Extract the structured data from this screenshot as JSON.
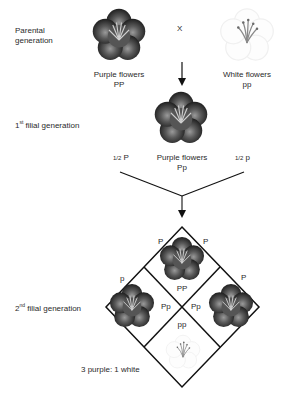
{
  "parental": {
    "label": "Parental generation",
    "label_line1": "Parental",
    "label_line2": "generation",
    "cross_symbol": "X",
    "purple_parent": {
      "phenotype": "Purple flowers",
      "genotype": "PP",
      "icon": "purple-flower"
    },
    "white_parent": {
      "phenotype": "White flowers",
      "genotype": "pp",
      "icon": "white-flower"
    }
  },
  "f1": {
    "label_prefix": "1",
    "label_sup": "st",
    "label_rest": " filial generation",
    "phenotype": "Purple flowers",
    "genotype": "Pp",
    "icon": "purple-flower",
    "gamete_left": {
      "fraction": "1/2",
      "allele": "P"
    },
    "gamete_right": {
      "fraction": "1/2",
      "allele": "p"
    }
  },
  "f2": {
    "label_prefix": "2",
    "label_sup": "nd",
    "label_rest": " filial generation",
    "punnett": {
      "edge_labels": {
        "top_left": "P",
        "top_right": "P",
        "left": "p",
        "right": "P"
      },
      "cells": [
        {
          "position": "top",
          "genotype": "PP",
          "icon": "purple-flower"
        },
        {
          "position": "left",
          "genotype": "Pp",
          "icon": "purple-flower"
        },
        {
          "position": "right",
          "genotype": "Pp",
          "icon": "purple-flower"
        },
        {
          "position": "bottom",
          "genotype": "pp",
          "icon": "white-flower"
        }
      ]
    },
    "ratio": "3 purple: 1 white"
  },
  "colors": {
    "line": "#111111",
    "purple_flower_dark": "#2b2b2b",
    "purple_flower_mid": "#6a6a6a",
    "white_flower_stamen": "#8a8a8a",
    "text": "#2a2a2a"
  }
}
